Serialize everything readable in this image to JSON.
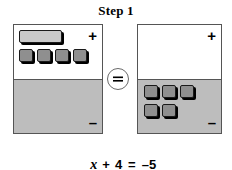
{
  "title": "Step 1",
  "equation": {
    "variable": "x",
    "plus_operator": "+",
    "constant": "4",
    "equals_operator": "=",
    "right_side": "–5",
    "full_text": "x + 4 = –5"
  },
  "equals_badge": {
    "symbol": "=",
    "label": "equals"
  },
  "colors": {
    "positive_region": "#ffffff",
    "negative_region": "#bdbdbd",
    "x_tile": "#c9c9c9",
    "unit_tile": "#8f8f8f",
    "outline": "#555555",
    "tile_outline": "#1a1a1a",
    "shadow": "#000000",
    "text": "#000000"
  },
  "mats": [
    {
      "id": "left-mat",
      "name": "left-expression-mat",
      "positive_sign": "+",
      "negative_sign": "–",
      "positive_region_label": "positive",
      "negative_region_label": "negative",
      "tiles": [
        {
          "type": "x-tile",
          "region": "positive",
          "value": "x",
          "count": 1
        },
        {
          "type": "unit-tile",
          "region": "positive",
          "value": "1",
          "count": 4
        }
      ],
      "x_tile_count": 1,
      "positive_unit_count": 4,
      "negative_unit_count": 0
    },
    {
      "id": "right-mat",
      "name": "right-expression-mat",
      "positive_sign": "+",
      "negative_sign": "–",
      "positive_region_label": "positive",
      "negative_region_label": "negative",
      "tiles": [
        {
          "type": "unit-tile",
          "region": "negative",
          "value": "-1",
          "count": 5
        }
      ],
      "x_tile_count": 0,
      "positive_unit_count": 0,
      "negative_unit_count": 5
    }
  ]
}
